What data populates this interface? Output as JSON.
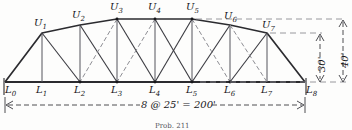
{
  "figure": {
    "type": "structural-truss-diagram",
    "caption": "Prob. 211"
  },
  "colors": {
    "ink": "#17171a",
    "chord": "#2b2b2f",
    "counter": "#8d8d93",
    "dimension": "#3a3a40",
    "paper": "#fdfdfc"
  },
  "lower_chord_nodes": [
    {
      "id": "L0",
      "label": "L",
      "sub": "0",
      "x": 5,
      "y": 82
    },
    {
      "id": "L1",
      "label": "L",
      "sub": "1",
      "x": 42,
      "y": 82
    },
    {
      "id": "L2",
      "label": "L",
      "sub": "2",
      "x": 80,
      "y": 82
    },
    {
      "id": "L3",
      "label": "L",
      "sub": "3",
      "x": 117,
      "y": 82
    },
    {
      "id": "L4",
      "label": "L",
      "sub": "4",
      "x": 155,
      "y": 82
    },
    {
      "id": "L5",
      "label": "L",
      "sub": "5",
      "x": 192,
      "y": 82
    },
    {
      "id": "L6",
      "label": "L",
      "sub": "6",
      "x": 230,
      "y": 82
    },
    {
      "id": "L7",
      "label": "L",
      "sub": "7",
      "x": 267,
      "y": 82
    },
    {
      "id": "L8",
      "label": "L",
      "sub": "8",
      "x": 305,
      "y": 82
    }
  ],
  "upper_chord_nodes": [
    {
      "id": "U1",
      "label": "U",
      "sub": "1",
      "x": 42,
      "y": 33
    },
    {
      "id": "U2",
      "label": "U",
      "sub": "2",
      "x": 80,
      "y": 25
    },
    {
      "id": "U3",
      "label": "U",
      "sub": "3",
      "x": 117,
      "y": 19
    },
    {
      "id": "U4",
      "label": "U",
      "sub": "4",
      "x": 155,
      "y": 19
    },
    {
      "id": "U5",
      "label": "U",
      "sub": "5",
      "x": 192,
      "y": 19
    },
    {
      "id": "U6",
      "label": "U",
      "sub": "6",
      "x": 230,
      "y": 25
    },
    {
      "id": "U7",
      "label": "U",
      "sub": "7",
      "x": 267,
      "y": 33
    }
  ],
  "dimensions": {
    "span": "8 @ 25' = 200'",
    "height_inner": "30'",
    "height_center": "40'"
  }
}
